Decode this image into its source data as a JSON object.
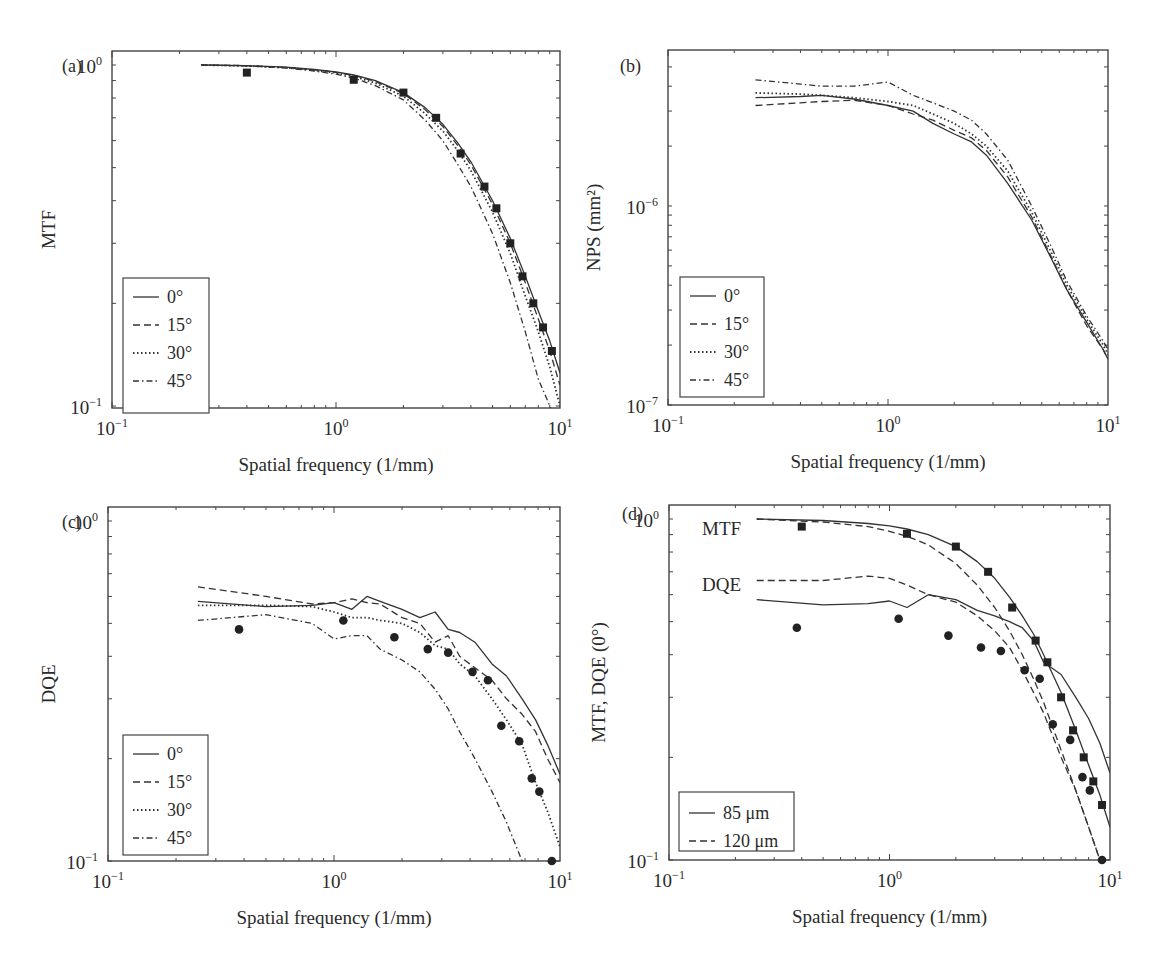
{
  "figure": {
    "panels": [
      {
        "id": "a",
        "label": "(a)",
        "ylabel": "MTF",
        "xlabel": "Spatial frequency (1/mm)"
      },
      {
        "id": "b",
        "label": "(b)",
        "ylabel": "NPS (mm²)",
        "xlabel": "Spatial frequency (1/mm)"
      },
      {
        "id": "c",
        "label": "(c)",
        "ylabel": "DQE",
        "xlabel": "Spatial frequency (1/mm)"
      },
      {
        "id": "d",
        "label": "(d)",
        "ylabel": "MTF, DQE (0°)",
        "xlabel": "Spatial frequency (1/mm)"
      }
    ]
  },
  "chart_data": [
    {
      "panel": "(a)",
      "type": "line",
      "title": "",
      "xlabel": "Spatial frequency (1/mm)",
      "ylabel": "MTF",
      "xscale": "log",
      "yscale": "log",
      "xlim": [
        0.1,
        10
      ],
      "ylim": [
        0.1,
        1.1
      ],
      "xticks": [
        "10⁻¹",
        "10⁰",
        "10¹"
      ],
      "yticks": [
        "10⁻¹",
        "10⁰"
      ],
      "legend": {
        "position": "lower left",
        "entries": [
          "0°",
          "15°",
          "30°",
          "45°"
        ]
      },
      "x": [
        0.25,
        0.4,
        0.6,
        0.8,
        1.0,
        1.2,
        1.5,
        2.0,
        2.5,
        3.0,
        3.5,
        4.0,
        5.0,
        6.0,
        7.0,
        8.0,
        9.0,
        10.0
      ],
      "series": [
        {
          "name": "0°",
          "style": "solid",
          "values": [
            1.0,
            0.995,
            0.985,
            0.97,
            0.955,
            0.935,
            0.9,
            0.83,
            0.75,
            0.67,
            0.59,
            0.52,
            0.4,
            0.31,
            0.24,
            0.19,
            0.155,
            0.125
          ]
        },
        {
          "name": "15°",
          "style": "dashed",
          "values": [
            1.0,
            0.995,
            0.984,
            0.968,
            0.952,
            0.932,
            0.895,
            0.825,
            0.74,
            0.66,
            0.58,
            0.51,
            0.39,
            0.3,
            0.23,
            0.18,
            0.145,
            0.115
          ]
        },
        {
          "name": "30°",
          "style": "dotted",
          "values": [
            1.0,
            0.994,
            0.982,
            0.965,
            0.948,
            0.925,
            0.885,
            0.81,
            0.72,
            0.64,
            0.56,
            0.49,
            0.37,
            0.28,
            0.21,
            0.165,
            0.13,
            0.1
          ]
        },
        {
          "name": "45°",
          "style": "dash-dot",
          "values": [
            1.0,
            0.993,
            0.98,
            0.96,
            0.94,
            0.915,
            0.87,
            0.79,
            0.69,
            0.6,
            0.51,
            0.44,
            0.32,
            0.23,
            0.165,
            0.12,
            0.1,
            null
          ]
        }
      ],
      "markers": {
        "shape": "square",
        "x": [
          0.4,
          1.2,
          2.0,
          2.8,
          3.6,
          4.6,
          5.2,
          6.0,
          6.8,
          7.6,
          8.4,
          9.2
        ],
        "y": [
          0.95,
          0.905,
          0.83,
          0.7,
          0.55,
          0.44,
          0.38,
          0.3,
          0.24,
          0.2,
          0.17,
          0.145
        ]
      }
    },
    {
      "panel": "(b)",
      "type": "line",
      "title": "",
      "xlabel": "Spatial frequency (1/mm)",
      "ylabel": "NPS (mm²)",
      "xscale": "log",
      "yscale": "log",
      "xlim": [
        0.1,
        10
      ],
      "ylim": [
        1e-07,
        6e-06
      ],
      "xticks": [
        "10⁻¹",
        "10⁰",
        "10¹"
      ],
      "yticks": [
        "10⁻⁷",
        "10⁻⁶"
      ],
      "legend": {
        "position": "lower left",
        "entries": [
          "0°",
          "15°",
          "30°",
          "45°"
        ]
      },
      "x": [
        0.25,
        0.4,
        0.5,
        0.7,
        1.0,
        1.3,
        1.6,
        2.0,
        2.4,
        2.8,
        3.5,
        4.5,
        5.5,
        6.5,
        8.0,
        9.5,
        10.0
      ],
      "series": [
        {
          "name": "0°",
          "style": "solid",
          "values": [
            3.5e-06,
            3.55e-06,
            3.6e-06,
            3.45e-06,
            3.2e-06,
            3e-06,
            2.6e-06,
            2.3e-06,
            2.1e-06,
            1.8e-06,
            1.3e-06,
            8.5e-07,
            5.5e-07,
            3.8e-07,
            2.6e-07,
            1.9e-07,
            1.7e-07
          ]
        },
        {
          "name": "15°",
          "style": "dashed",
          "values": [
            3.2e-06,
            3.3e-06,
            3.35e-06,
            3.4e-06,
            3.2e-06,
            2.9e-06,
            2.7e-06,
            2.4e-06,
            2.2e-06,
            1.9e-06,
            1.4e-06,
            8.8e-07,
            5.6e-07,
            3.8e-07,
            2.5e-07,
            1.9e-07,
            1.7e-07
          ]
        },
        {
          "name": "30°",
          "style": "dotted",
          "values": [
            3.7e-06,
            3.65e-06,
            3.6e-06,
            3.5e-06,
            3.35e-06,
            3.2e-06,
            2.9e-06,
            2.6e-06,
            2.3e-06,
            2e-06,
            1.5e-06,
            9.3e-07,
            5.9e-07,
            4e-07,
            2.7e-07,
            2e-07,
            1.8e-07
          ]
        },
        {
          "name": "45°",
          "style": "dash-dot",
          "values": [
            4.3e-06,
            4.1e-06,
            4e-06,
            4e-06,
            4.2e-06,
            3.6e-06,
            3.3e-06,
            3e-06,
            2.7e-06,
            2.3e-06,
            1.7e-06,
            1e-06,
            6.3e-07,
            4.2e-07,
            2.8e-07,
            2.1e-07,
            1.9e-07
          ]
        }
      ]
    },
    {
      "panel": "(c)",
      "type": "line",
      "title": "",
      "xlabel": "Spatial frequency (1/mm)",
      "ylabel": "DQE",
      "xscale": "log",
      "yscale": "log",
      "xlim": [
        0.1,
        10
      ],
      "ylim": [
        0.1,
        1.1
      ],
      "xticks": [
        "10⁻¹",
        "10⁰",
        "10¹"
      ],
      "yticks": [
        "10⁻¹",
        "10⁰"
      ],
      "legend": {
        "position": "lower left",
        "entries": [
          "0°",
          "15°",
          "30°",
          "45°"
        ]
      },
      "x": [
        0.25,
        0.5,
        0.8,
        1.0,
        1.2,
        1.4,
        1.6,
        2.0,
        2.4,
        2.8,
        3.2,
        3.6,
        4.2,
        5.0,
        5.8,
        6.8,
        7.8,
        8.8,
        10.0
      ],
      "series": [
        {
          "name": "0°",
          "style": "solid",
          "values": [
            0.58,
            0.56,
            0.565,
            0.575,
            0.55,
            0.6,
            0.58,
            0.55,
            0.52,
            0.54,
            0.48,
            0.47,
            0.44,
            0.38,
            0.35,
            0.3,
            0.26,
            0.22,
            0.18
          ]
        },
        {
          "name": "15°",
          "style": "dashed",
          "values": [
            0.64,
            0.6,
            0.57,
            0.575,
            0.59,
            0.575,
            0.57,
            0.52,
            0.5,
            0.44,
            0.46,
            0.4,
            0.37,
            0.34,
            0.3,
            0.27,
            0.24,
            0.2,
            0.17
          ]
        },
        {
          "name": "30°",
          "style": "dotted",
          "values": [
            0.565,
            0.565,
            0.56,
            0.54,
            0.52,
            0.52,
            0.51,
            0.5,
            0.47,
            0.43,
            0.42,
            0.38,
            0.35,
            0.3,
            0.26,
            0.22,
            0.17,
            0.14,
            0.11
          ]
        },
        {
          "name": "45°",
          "style": "dash-dot",
          "values": [
            0.51,
            0.53,
            0.5,
            0.45,
            0.46,
            0.46,
            0.42,
            0.39,
            0.36,
            0.32,
            0.28,
            0.24,
            0.2,
            0.16,
            0.13,
            0.1,
            null,
            null,
            null
          ]
        }
      ],
      "markers": {
        "shape": "circle",
        "x": [
          0.38,
          1.1,
          1.85,
          2.6,
          3.2,
          4.1,
          4.8,
          5.5,
          6.6,
          7.5,
          8.1,
          9.2
        ],
        "y": [
          0.48,
          0.51,
          0.455,
          0.42,
          0.41,
          0.36,
          0.34,
          0.25,
          0.225,
          0.175,
          0.16,
          0.1
        ]
      }
    },
    {
      "panel": "(d)",
      "type": "line",
      "title": "",
      "xlabel": "Spatial frequency (1/mm)",
      "ylabel": "MTF, DQE (0°)",
      "xscale": "log",
      "yscale": "log",
      "xlim": [
        0.1,
        10
      ],
      "ylim": [
        0.1,
        1.1
      ],
      "xticks": [
        "10⁻¹",
        "10⁰",
        "10¹"
      ],
      "yticks": [
        "10⁻¹",
        "10⁰"
      ],
      "annotations": [
        "MTF",
        "DQE"
      ],
      "legend": {
        "position": "lower left",
        "entries": [
          "85 μm",
          "120 μm"
        ]
      },
      "x": [
        0.25,
        0.5,
        0.8,
        1.0,
        1.2,
        1.5,
        2.0,
        2.5,
        3.0,
        3.5,
        4.0,
        4.5,
        5.0,
        6.0,
        7.0,
        8.0,
        9.0,
        10.0
      ],
      "series": [
        {
          "name": "MTF 85 μm",
          "style": "solid",
          "values": [
            1.0,
            0.99,
            0.97,
            0.955,
            0.935,
            0.9,
            0.83,
            0.75,
            0.67,
            0.59,
            0.52,
            0.46,
            0.4,
            0.31,
            0.24,
            0.19,
            0.155,
            0.125
          ]
        },
        {
          "name": "MTF 120 μm",
          "style": "dashed",
          "values": [
            1.0,
            0.98,
            0.95,
            0.92,
            0.89,
            0.84,
            0.74,
            0.64,
            0.55,
            0.47,
            0.4,
            0.34,
            0.29,
            0.21,
            0.16,
            0.125,
            0.1,
            null
          ]
        },
        {
          "name": "DQE 85 μm",
          "style": "solid",
          "values": [
            0.58,
            0.56,
            0.565,
            0.575,
            0.55,
            0.6,
            0.58,
            0.54,
            0.52,
            0.5,
            0.48,
            0.44,
            0.38,
            0.35,
            0.3,
            0.26,
            0.22,
            0.18
          ]
        },
        {
          "name": "DQE 120 μm",
          "style": "dashed",
          "values": [
            0.66,
            0.66,
            0.68,
            0.67,
            0.64,
            0.6,
            0.57,
            0.52,
            0.47,
            0.42,
            0.36,
            0.31,
            0.27,
            0.2,
            0.16,
            0.125,
            0.1,
            null
          ]
        }
      ],
      "markers": [
        {
          "shape": "square",
          "x": [
            0.4,
            1.2,
            2.0,
            2.8,
            3.6,
            4.6,
            5.2,
            6.0,
            6.8,
            7.6,
            8.4,
            9.2
          ],
          "y": [
            0.95,
            0.905,
            0.83,
            0.7,
            0.55,
            0.44,
            0.38,
            0.3,
            0.24,
            0.2,
            0.17,
            0.145
          ]
        },
        {
          "shape": "circle",
          "x": [
            0.38,
            1.1,
            1.85,
            2.6,
            3.2,
            4.1,
            4.8,
            5.5,
            6.6,
            7.5,
            8.1,
            9.2
          ],
          "y": [
            0.48,
            0.51,
            0.455,
            0.42,
            0.41,
            0.36,
            0.34,
            0.25,
            0.225,
            0.175,
            0.16,
            0.1
          ]
        }
      ]
    }
  ]
}
